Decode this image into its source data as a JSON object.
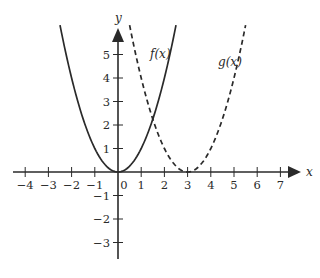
{
  "chart_data": {
    "type": "line",
    "title": "",
    "xlabel": "x",
    "ylabel": "y",
    "xlim": [
      -4.5,
      7.5
    ],
    "ylim": [
      -3.7,
      6.2
    ],
    "grid": false,
    "legend": "inline labels near curves",
    "x_ticks": [
      -4,
      -3,
      -2,
      -1,
      0,
      1,
      2,
      3,
      4,
      5,
      6,
      7
    ],
    "x_tick_labels": [
      "−4",
      "−3",
      "−2",
      "−1",
      "0",
      "1",
      "2",
      "3",
      "4",
      "5",
      "6",
      "7"
    ],
    "y_ticks": [
      -3,
      -2,
      -1,
      1,
      2,
      3,
      4,
      5
    ],
    "y_tick_labels": [
      "−3",
      "−2",
      "−1",
      "1",
      "2",
      "3",
      "4",
      "5"
    ],
    "series": [
      {
        "name": "f(x)",
        "formula": "x^2",
        "style": "solid",
        "x": [
          -2.5,
          -2,
          -1.5,
          -1,
          -0.5,
          0,
          0.5,
          1,
          1.5,
          2,
          2.5
        ],
        "y": [
          6.25,
          4,
          2.25,
          1,
          0.25,
          0,
          0.25,
          1,
          2.25,
          4,
          6.25
        ]
      },
      {
        "name": "g(x)",
        "formula": "(x-3)^2",
        "style": "dashed",
        "x": [
          0.5,
          1,
          1.5,
          2,
          2.5,
          3,
          3.5,
          4,
          4.5,
          5,
          5.5
        ],
        "y": [
          6.25,
          4,
          2.25,
          1,
          0.25,
          0,
          0.25,
          1,
          2.25,
          4,
          6.25
        ]
      }
    ],
    "annotations": [
      {
        "text": "f(x)",
        "near": [
          1.5,
          5.0
        ]
      },
      {
        "text": "g(x)",
        "near": [
          4.5,
          4.6
        ]
      }
    ]
  },
  "labels": {
    "x_axis": "x",
    "y_axis": "y",
    "f_label": "f(x)",
    "g_label": "g(x)"
  },
  "colors": {
    "ink": "#2a2a2a",
    "background": "#ffffff"
  }
}
